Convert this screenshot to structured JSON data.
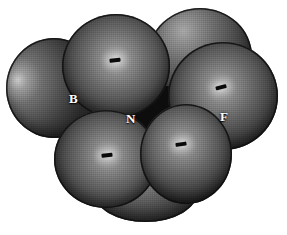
{
  "figure": {
    "kind": "space-filling-molecular-model",
    "title": "",
    "background_color": "#ffffff",
    "style": "grayscale CPK / van der Waals space-filling model",
    "atoms": [
      {
        "id": "atom-left",
        "element_label": "",
        "name": "fluorine-left",
        "role": "left fluorine sphere",
        "color": "#6e6e6e",
        "highlight": "left crescent",
        "has_tick": false
      },
      {
        "id": "atom-top",
        "element_label": "",
        "name": "fluorine-top",
        "role": "top fluorine sphere",
        "color": "#7a7a7a",
        "highlight": "center",
        "has_tick": true
      },
      {
        "id": "atom-upper-right",
        "element_label": "",
        "name": "hydrogen-upper-right",
        "role": "upper right sphere",
        "color": "#636363",
        "highlight": "upper-left",
        "has_tick": false
      },
      {
        "id": "atom-right",
        "element_label": "F",
        "name": "fluorine-right",
        "role": "right fluorine sphere",
        "color": "#767676",
        "highlight": "center",
        "has_tick": true
      },
      {
        "id": "atom-bottom-left",
        "element_label": "",
        "name": "hydrogen-bottom-left",
        "role": "bottom left sphere",
        "color": "#787878",
        "highlight": "center",
        "has_tick": true
      },
      {
        "id": "atom-bottom-right",
        "element_label": "",
        "name": "hydrogen-bottom-right",
        "role": "bottom right sphere",
        "color": "#747474",
        "highlight": "center",
        "has_tick": true
      },
      {
        "id": "atom-back-bottom",
        "element_label": "",
        "name": "hydrogen-back-bottom",
        "role": "partially occluded rear sphere at bottom",
        "color": "#5d5d5d",
        "highlight": "none",
        "has_tick": false
      }
    ],
    "labels": [
      {
        "text": "B",
        "name": "atom-label-boron",
        "color": "#ffffff"
      },
      {
        "text": "N",
        "name": "atom-label-nitrogen",
        "color": "#ffffff"
      },
      {
        "text": "F",
        "name": "atom-label-fluorine",
        "color": "#ffffff"
      }
    ]
  }
}
